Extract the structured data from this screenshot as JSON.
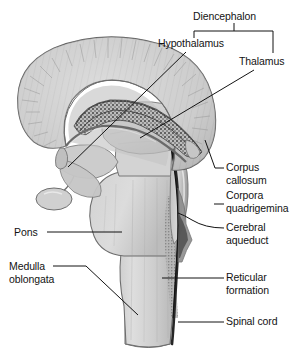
{
  "figure": {
    "kind": "mid-sagittal-brain-section-diagram",
    "width": 298,
    "height": 352,
    "background_color": "#ffffff",
    "ink_color": "#131313"
  },
  "labels": {
    "diencephalon": "Diencephalon",
    "hypothalamus": "Hypothalamus",
    "thalamus": "Thalamus",
    "corpus_callosum_line1": "Corpus",
    "corpus_callosum_line2": "callosum",
    "corpora_quadrigemina_line1": "Corpora",
    "corpora_quadrigemina_line2": "quadrigemina",
    "cerebral_aqueduct_line1": "Cerebral",
    "cerebral_aqueduct_line2": "aqueduct",
    "pons": "Pons",
    "medulla_line1": "Medulla",
    "medulla_line2": "oblongata",
    "reticular_formation_line1": "Reticular",
    "reticular_formation_line2": "formation",
    "spinal_cord": "Spinal cord"
  },
  "structures": [
    {
      "name": "cerebrum",
      "note": "large arc of cerebral cortex with radiating striations, upper left"
    },
    {
      "name": "corpus-callosum",
      "note": "stippled curved band beneath the cerebral arc"
    },
    {
      "name": "fornix",
      "note": "thin arc below the corpus callosum"
    },
    {
      "name": "thalamus",
      "note": "ovoid mass at the centre of the section"
    },
    {
      "name": "hypothalamus",
      "note": "region below and in front of the thalamus"
    },
    {
      "name": "corpora-quadrigemina",
      "note": "four rounded elevations on the dorsal midbrain"
    },
    {
      "name": "cerebral-aqueduct",
      "note": "dark narrow channel through the midbrain"
    },
    {
      "name": "pons",
      "note": "rounded ventral bulge of the brainstem"
    },
    {
      "name": "medulla-oblongata",
      "note": "tapering lower brainstem"
    },
    {
      "name": "reticular-formation",
      "note": "speckled core of the brainstem"
    },
    {
      "name": "spinal-cord",
      "note": "continuation of the brainstem below the medulla"
    },
    {
      "name": "cerebellum-cut-edge",
      "note": "small lobe at lower left of the midbrain"
    }
  ],
  "palette": {
    "tissue_light": "#d9d9d9",
    "tissue_mid": "#c2c2c2",
    "tissue_dark": "#9a9a9a",
    "outline": "#5a5a5a",
    "channel_dark": "#2b2b2b",
    "highlight": "#ececec"
  }
}
